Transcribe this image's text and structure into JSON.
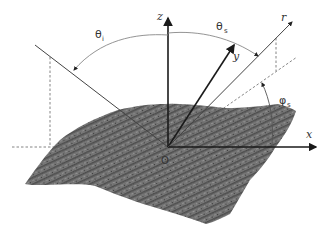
{
  "diagram": {
    "type": "scattering-geometry",
    "labels": {
      "z_axis": "z",
      "y_axis": "y",
      "x_axis": "x",
      "r_ray": "r",
      "origin": "O",
      "theta_i": "θ",
      "theta_i_sub": "i",
      "theta_s": "θ",
      "theta_s_sub": "s",
      "phi_s": "φ",
      "phi_s_sub": "s"
    },
    "colors": {
      "surface_fill": "#7a7a7a",
      "surface_dark": "#4a4a4a",
      "axis_line": "#1a1a1a",
      "thin_line": "#555555",
      "arc_line": "#888888",
      "dashed_line": "#666666",
      "background": "#ffffff"
    },
    "elements": [
      "rough-surface",
      "x-axis",
      "y-axis",
      "z-axis",
      "incident-ray",
      "scattered-ray-r",
      "projection-of-r",
      "theta-i-arc",
      "theta-s-arc",
      "phi-s-arc",
      "horizontal-dashed-reference",
      "vertical-dashed-drops"
    ]
  }
}
